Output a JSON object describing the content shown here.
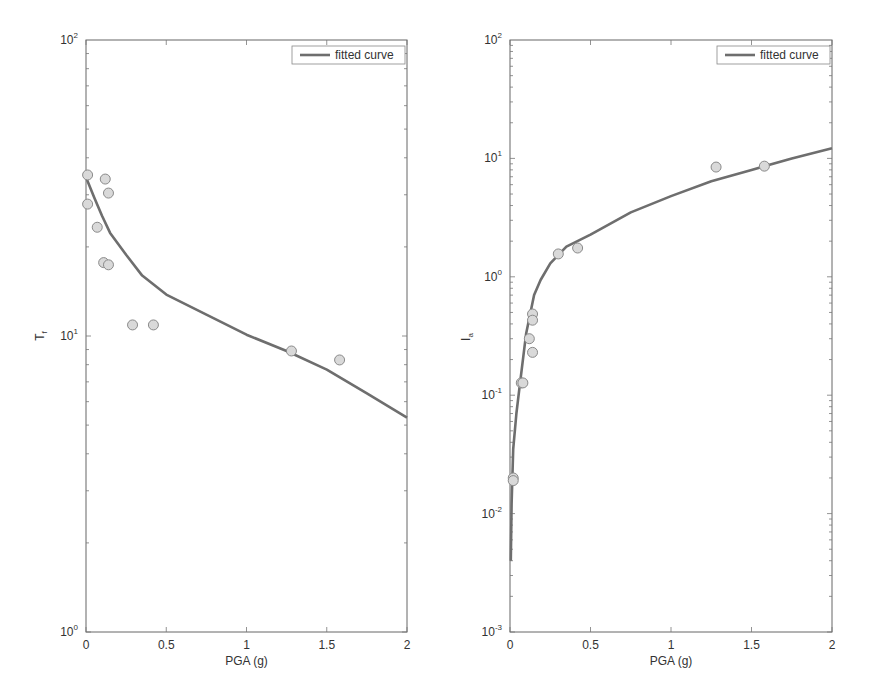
{
  "chart_data": [
    {
      "type": "scatter",
      "title": "",
      "xlabel": "PGA (g)",
      "ylabel": "T",
      "ylabel_subscript": "f",
      "xlim": [
        0,
        2
      ],
      "ylim": [
        1,
        100
      ],
      "yscale": "log",
      "xticks": [
        "0",
        "0.5",
        "1",
        "1.5",
        "2"
      ],
      "yticks": [
        {
          "base": "10",
          "exp": "0"
        },
        {
          "base": "10",
          "exp": "1"
        },
        {
          "base": "10",
          "exp": "2"
        }
      ],
      "grid": false,
      "legend": {
        "position": "upper right",
        "entries": [
          "fitted curve"
        ]
      },
      "series": [
        {
          "name": "data",
          "kind": "scatter",
          "x": [
            0.01,
            0.01,
            0.12,
            0.14,
            0.07,
            0.11,
            0.14,
            0.29,
            0.42,
            1.28,
            1.58
          ],
          "y": [
            35,
            27.9,
            33.9,
            30.4,
            23.3,
            17.7,
            17.4,
            10.9,
            10.9,
            8.9,
            8.3
          ]
        },
        {
          "name": "fitted curve",
          "kind": "line",
          "x": [
            0,
            0.05,
            0.1,
            0.15,
            0.25,
            0.35,
            0.5,
            0.75,
            1.0,
            1.25,
            1.5,
            1.75,
            2.0
          ],
          "y": [
            34.4,
            29.5,
            25.5,
            22.3,
            18.8,
            16.0,
            13.8,
            11.8,
            10.1,
            8.9,
            7.7,
            6.4,
            5.3
          ]
        }
      ]
    },
    {
      "type": "scatter",
      "title": "",
      "xlabel": "PGA (g)",
      "ylabel": "I",
      "ylabel_subscript": "a",
      "xlim": [
        0,
        2
      ],
      "ylim": [
        0.001,
        100
      ],
      "yscale": "log",
      "xticks": [
        "0",
        "0.5",
        "1",
        "1.5",
        "2"
      ],
      "yticks": [
        {
          "base": "10",
          "exp": "-3"
        },
        {
          "base": "10",
          "exp": "-2"
        },
        {
          "base": "10",
          "exp": "-1"
        },
        {
          "base": "10",
          "exp": "0"
        },
        {
          "base": "10",
          "exp": "1"
        },
        {
          "base": "10",
          "exp": "2"
        }
      ],
      "grid": false,
      "legend": {
        "position": "upper right",
        "entries": [
          "fitted curve"
        ]
      },
      "series": [
        {
          "name": "data",
          "kind": "scatter",
          "x": [
            0.3,
            0.42,
            0.14,
            0.14,
            0.12,
            0.14,
            0.07,
            0.08,
            0.02,
            0.02,
            1.28,
            1.58
          ],
          "y": [
            1.56,
            1.75,
            0.485,
            0.43,
            0.3,
            0.23,
            0.127,
            0.127,
            0.02,
            0.019,
            8.45,
            8.6
          ]
        },
        {
          "name": "fitted curve",
          "kind": "line",
          "x": [
            0.005,
            0.01,
            0.02,
            0.04,
            0.06,
            0.1,
            0.15,
            0.19,
            0.25,
            0.35,
            0.5,
            0.75,
            1.0,
            1.25,
            1.5,
            1.75,
            2.0
          ],
          "y": [
            0.004,
            0.012,
            0.035,
            0.07,
            0.12,
            0.33,
            0.7,
            0.94,
            1.3,
            1.8,
            2.27,
            3.5,
            4.8,
            6.4,
            8.0,
            10.0,
            12.2
          ]
        }
      ]
    }
  ]
}
